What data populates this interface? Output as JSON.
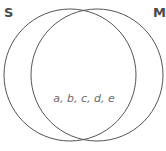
{
  "diagram": {
    "type": "venn",
    "sets": [
      {
        "label": "S",
        "cx": 70,
        "cy": 75,
        "r": 66
      },
      {
        "label": "M",
        "cx": 97,
        "cy": 75,
        "r": 66
      }
    ],
    "intersection_text": "a, b, c, d, e",
    "stroke_color": "#555555"
  }
}
